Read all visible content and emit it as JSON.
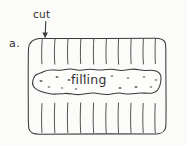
{
  "figure": {
    "domain": "diagram",
    "caption_letter": "a.",
    "background_color": "#fbfbfa",
    "ink_color": "#3a3a3a",
    "width_px": 187,
    "height_px": 146
  },
  "labels": {
    "item_letter": "a.",
    "cut": "cut",
    "filling": "filling"
  },
  "annotations": {
    "arrow": {
      "name": "cut-arrow",
      "points_to": "top-edge-of-dough",
      "direction": "down",
      "from_x": 46,
      "from_y": 22,
      "to_x": 45,
      "to_y": 38
    }
  },
  "shapes": {
    "dough_rectangle": {
      "name": "dough-rectangle",
      "left": 28,
      "top": 38,
      "right": 166,
      "bottom": 134,
      "corner_radius": 11,
      "style": "rounded rectangle, hand-drawn outline"
    },
    "filling_blob": {
      "name": "filling-blob",
      "left": 33,
      "top": 69,
      "right": 161,
      "bottom": 95,
      "style": "lumpy wavy closed curve with speckles"
    },
    "top_cuts": {
      "name": "top-cut-marks",
      "count": 10,
      "y_start": 40,
      "y_end": 64,
      "x_positions": [
        42,
        55,
        68,
        81,
        94,
        106,
        118,
        131,
        143,
        155
      ]
    },
    "bottom_cuts": {
      "name": "bottom-cut-marks",
      "count": 10,
      "y_start": 104,
      "y_end": 132,
      "x_positions": [
        42,
        55,
        68,
        81,
        94,
        106,
        118,
        131,
        143,
        155
      ]
    },
    "specks": {
      "name": "filling-specks",
      "count": 14,
      "color": "#6e6e6e"
    }
  }
}
